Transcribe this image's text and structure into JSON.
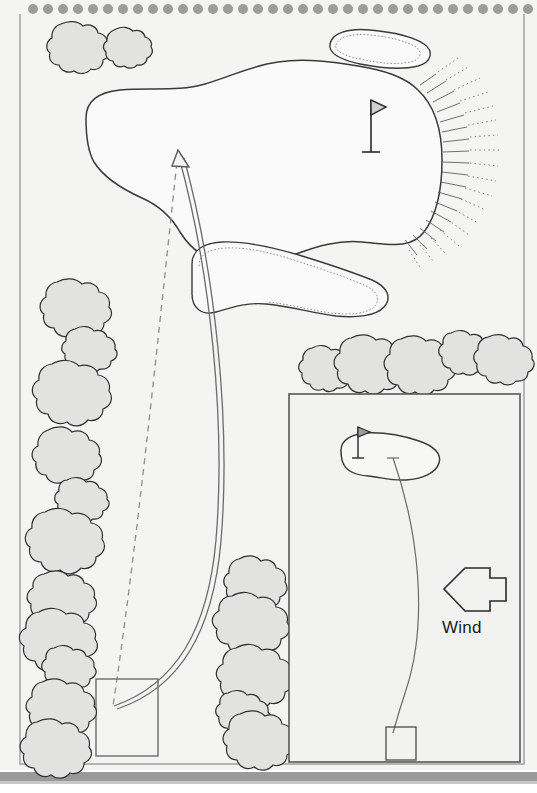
{
  "document": {
    "kind": "golf-yardage-book-page",
    "binding": "spiral",
    "page_bg": "#f4f4f3",
    "ink": "#3a3a3a",
    "tree_fill": "#e2e2e1",
    "bottom_bar": "#9a9a9a"
  },
  "annotations": {
    "wind_label": "Wind"
  },
  "diagram": {
    "main": {
      "green_label": "",
      "flag_count": 1,
      "bunkers": 2,
      "tee_boxes": 1,
      "shot_line": "curved-draw",
      "aim_line": "dashed-straight",
      "slope_hatching": "right-of-green"
    },
    "inset": {
      "green_label": "",
      "flag_count": 1,
      "tee_boxes": 1,
      "shot_line": "curved",
      "wind_arrow_direction": "left"
    },
    "trees": {
      "top_left_cluster": 2,
      "left_column": 11,
      "right_row": 5,
      "center_column": 5
    }
  },
  "binding_holes": {
    "count": 33,
    "color": "#9c9c9c"
  }
}
